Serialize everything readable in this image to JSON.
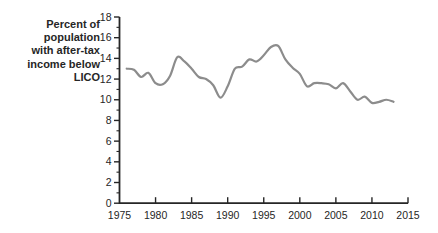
{
  "chart_data": {
    "type": "line",
    "title": "",
    "xlabel": "",
    "ylabel": "Percent of population with after-tax income below LICO",
    "ylabel_lines": [
      "Percent of",
      "population",
      "with after-tax",
      "income below",
      "LICO"
    ],
    "x": [
      1976,
      1977,
      1978,
      1979,
      1980,
      1981,
      1982,
      1983,
      1984,
      1985,
      1986,
      1987,
      1988,
      1989,
      1990,
      1991,
      1992,
      1993,
      1994,
      1995,
      1996,
      1997,
      1998,
      1999,
      2000,
      2001,
      2002,
      2003,
      2004,
      2005,
      2006,
      2007,
      2008,
      2009,
      2010,
      2011,
      2012,
      2013
    ],
    "values": [
      13.0,
      12.9,
      12.2,
      12.6,
      11.6,
      11.5,
      12.3,
      14.1,
      13.7,
      13.0,
      12.2,
      12.0,
      11.4,
      10.2,
      11.3,
      13.0,
      13.2,
      13.9,
      13.7,
      14.3,
      15.1,
      15.2,
      13.9,
      13.1,
      12.5,
      11.3,
      11.6,
      11.6,
      11.5,
      11.1,
      11.6,
      10.8,
      10.0,
      10.3,
      9.7,
      9.8,
      10.0,
      9.8
    ],
    "xlim": [
      1975,
      2015
    ],
    "ylim": [
      0,
      18
    ],
    "x_ticks": [
      1975,
      1980,
      1985,
      1990,
      1995,
      2000,
      2005,
      2010,
      2015
    ],
    "y_ticks": [
      0,
      2,
      4,
      6,
      8,
      10,
      12,
      14,
      16,
      18
    ],
    "y_minor_ticks": [
      1,
      3,
      5,
      7,
      9,
      11,
      13,
      15,
      17
    ],
    "grid": "off",
    "legend": "none",
    "line_color": "#8c8c8c",
    "axis_color": "#262626",
    "text_color": "#262626",
    "background": "#ffffff"
  }
}
